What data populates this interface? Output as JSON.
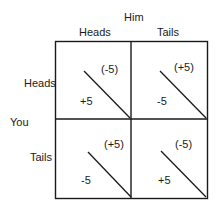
{
  "diagram": {
    "type": "payoff-matrix",
    "column_player": "Him",
    "row_player": "You",
    "columns": [
      "Heads",
      "Tails"
    ],
    "rows": [
      "Heads",
      "Tails"
    ],
    "cells": [
      [
        {
          "row": "Heads",
          "col": "Heads",
          "you": "+5",
          "him": "(-5)"
        },
        {
          "row": "Heads",
          "col": "Tails",
          "you": "-5",
          "him": "(+5)"
        }
      ],
      [
        {
          "row": "Tails",
          "col": "Heads",
          "you": "-5",
          "him": "(+5)"
        },
        {
          "row": "Tails",
          "col": "Tails",
          "you": "+5",
          "him": "(-5)"
        }
      ]
    ]
  },
  "colors": {
    "line": "#1a1a1a",
    "background": "#ffffff"
  }
}
